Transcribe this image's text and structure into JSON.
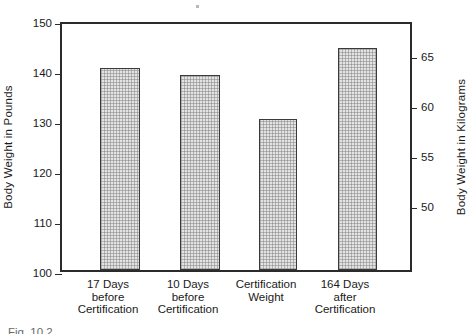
{
  "chart_data": {
    "type": "bar",
    "title": "",
    "categories": [
      "17 Days\nbefore\nCertification",
      "10 Days\nbefore\nCertification",
      "Certification\nWeight",
      "164 Days\nafter\nCertification"
    ],
    "values": [
      140.5,
      139.0,
      130.2,
      144.5
    ],
    "values_kg": [
      63.7,
      63.0,
      59.1,
      65.5
    ],
    "xlabel": "",
    "ylabel": "Body Weight in Pounds",
    "ylabel_secondary": "Body Weight in Kilograms",
    "ylim": [
      100,
      150
    ],
    "ylim_secondary": [
      45.36,
      68.04
    ],
    "yticks": [
      100,
      110,
      120,
      130,
      140,
      150
    ],
    "yticklabels": [
      "100",
      "110",
      "120",
      "130",
      "140",
      "150"
    ],
    "yticks_secondary": [
      50,
      55,
      60,
      65
    ],
    "yticklabels_secondary": [
      "50",
      "55",
      "60",
      "65"
    ],
    "grid": false,
    "legend": "none",
    "bar_facecolor": "#e3e3e3",
    "bar_edgecolor": "#3a3a3a",
    "axis_color": "#2b2b2b",
    "background": "#ffffff"
  },
  "caption": {
    "bottom_clipped_text": "Fig. 10.2"
  }
}
